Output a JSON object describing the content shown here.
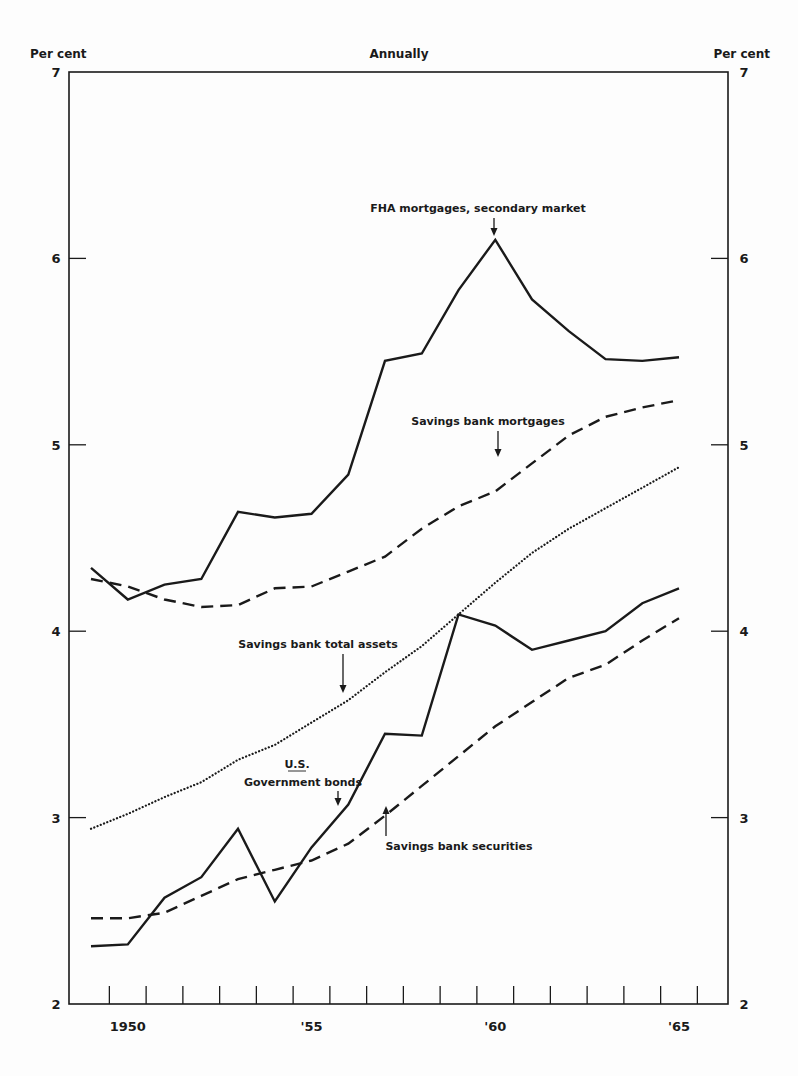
{
  "header": {
    "left_unit": "Per cent",
    "title": "Annually",
    "right_unit": "Per cent"
  },
  "annotations": {
    "fha": "FHA mortgages, secondary market",
    "sb_mortgages": "Savings bank mortgages",
    "sb_total_assets": "Savings bank total assets",
    "us_govt_line1": "U.S.",
    "us_govt_line2": "Government bonds",
    "sb_securities": "Savings bank securities"
  },
  "chart_data": {
    "type": "line",
    "title": "Annually",
    "xlabel": "",
    "ylabel": "Per cent",
    "ylim": [
      2,
      7
    ],
    "yticks": [
      2,
      3,
      4,
      5,
      6,
      7
    ],
    "xtick_labels": [
      {
        "year": 1950,
        "label": "1950"
      },
      {
        "year": 1955,
        "label": "'55"
      },
      {
        "year": 1960,
        "label": "'60"
      },
      {
        "year": 1965,
        "label": "'65"
      }
    ],
    "grid": false,
    "legend": "inline annotations with arrows",
    "x": [
      1949,
      1950,
      1951,
      1952,
      1953,
      1954,
      1955,
      1956,
      1957,
      1958,
      1959,
      1960,
      1961,
      1962,
      1963,
      1964,
      1965
    ],
    "series": [
      {
        "name": "FHA mortgages, secondary market",
        "style": "solid",
        "values": [
          4.34,
          4.17,
          4.25,
          4.28,
          4.64,
          4.61,
          4.63,
          4.84,
          5.45,
          5.49,
          5.83,
          6.1,
          5.78,
          5.61,
          5.46,
          5.45,
          5.47
        ]
      },
      {
        "name": "Savings bank mortgages",
        "style": "dashed",
        "values": [
          4.28,
          4.24,
          4.17,
          4.13,
          4.14,
          4.23,
          4.24,
          4.32,
          4.4,
          4.55,
          4.67,
          4.75,
          4.9,
          5.05,
          5.15,
          5.2,
          5.24
        ]
      },
      {
        "name": "Savings bank total assets",
        "style": "dotted",
        "values": [
          2.94,
          3.02,
          3.11,
          3.19,
          3.31,
          3.39,
          3.51,
          3.63,
          3.78,
          3.92,
          4.09,
          4.26,
          4.42,
          4.55,
          4.66,
          4.77,
          4.88
        ]
      },
      {
        "name": "U.S. Government bonds",
        "style": "solid",
        "values": [
          2.31,
          2.32,
          2.57,
          2.68,
          2.94,
          2.55,
          2.84,
          3.07,
          3.45,
          3.44,
          4.09,
          4.03,
          3.9,
          3.95,
          4.0,
          4.15,
          4.23
        ]
      },
      {
        "name": "Savings bank securities",
        "style": "dashed",
        "values": [
          2.46,
          2.46,
          2.49,
          2.58,
          2.67,
          2.72,
          2.77,
          2.86,
          3.01,
          3.17,
          3.33,
          3.49,
          3.62,
          3.75,
          3.82,
          3.95,
          4.07
        ]
      }
    ]
  }
}
